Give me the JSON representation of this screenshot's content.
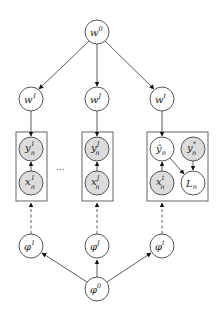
{
  "diagram": {
    "type": "graphical-model",
    "colors": {
      "observed_fill": "#dcdcdc",
      "latent_fill": "#ffffff",
      "stroke": "#444444"
    },
    "nodes": {
      "w0": {
        "base": "w",
        "sup": "0",
        "sub": "",
        "observed": false
      },
      "w1": {
        "base": "w",
        "sup": "1",
        "sub": "",
        "observed": false
      },
      "wJ": {
        "base": "w",
        "sup": "J",
        "sub": "",
        "observed": false
      },
      "wt": {
        "base": "w",
        "sup": "t",
        "sub": "",
        "observed": false
      },
      "y1": {
        "base": "y",
        "sup": "1",
        "sub": "n",
        "observed": true
      },
      "x1": {
        "base": "x",
        "sup": "1",
        "sub": "n",
        "observed": true
      },
      "yJ": {
        "base": "y",
        "sup": "J",
        "sub": "n",
        "observed": true
      },
      "xJ": {
        "base": "x",
        "sup": "J",
        "sub": "n",
        "observed": true
      },
      "yhat": {
        "base": "ŷ",
        "sup": "",
        "sub": "n",
        "observed": false
      },
      "ystar": {
        "base": "y",
        "sup": "*",
        "sub": "n",
        "observed": true
      },
      "xt": {
        "base": "x",
        "sup": "t",
        "sub": "n",
        "observed": true
      },
      "Ln": {
        "base": "L",
        "sup": "",
        "sub": "n",
        "observed": false
      },
      "phi1": {
        "base": "φ",
        "sup": "1",
        "sub": "",
        "observed": false
      },
      "phiJ": {
        "base": "φ",
        "sup": "J",
        "sub": "",
        "observed": false
      },
      "phit": {
        "base": "φ",
        "sup": "t",
        "sub": "",
        "observed": false
      },
      "phi0": {
        "base": "φ",
        "sup": "0",
        "sub": "",
        "observed": false
      }
    },
    "ellipsis": "···",
    "edges": [
      [
        "w0",
        "w1",
        "solid"
      ],
      [
        "w0",
        "wJ",
        "solid"
      ],
      [
        "w0",
        "wt",
        "solid"
      ],
      [
        "w1",
        "plate1",
        "solid"
      ],
      [
        "wJ",
        "plateJ",
        "solid"
      ],
      [
        "wt",
        "platet",
        "solid"
      ],
      [
        "x1",
        "y1",
        "solid"
      ],
      [
        "xJ",
        "yJ",
        "solid"
      ],
      [
        "xt",
        "yhat",
        "solid"
      ],
      [
        "yhat",
        "Ln",
        "solid"
      ],
      [
        "ystar",
        "Ln",
        "solid"
      ],
      [
        "phi1",
        "plate1",
        "dashed"
      ],
      [
        "phiJ",
        "plateJ",
        "dashed"
      ],
      [
        "phit",
        "platet",
        "dashed"
      ],
      [
        "phi0",
        "phi1",
        "solid"
      ],
      [
        "phi0",
        "phiJ",
        "solid"
      ],
      [
        "phi0",
        "phit",
        "solid"
      ]
    ]
  }
}
